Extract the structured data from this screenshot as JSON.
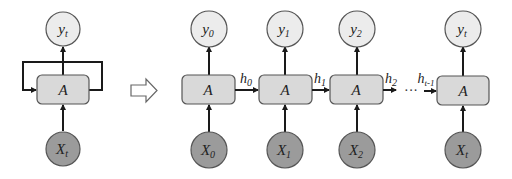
{
  "diagram": {
    "colors": {
      "output_fill": "#ececec",
      "input_fill": "#9b9b9b",
      "cell_fill": "#d9d9d9",
      "stroke": "#555555",
      "edge": "#1a1a1a"
    },
    "folded": {
      "output": {
        "base": "y",
        "sub": "t"
      },
      "cell": "A",
      "input": {
        "base": "X",
        "sub": "t"
      }
    },
    "transform_arrow": "unroll-arrow",
    "unrolled": [
      {
        "output": {
          "base": "y",
          "sub": "0"
        },
        "cell": "A",
        "input": {
          "base": "X",
          "sub": "0"
        },
        "hidden_out": {
          "base": "h",
          "sub": "0"
        }
      },
      {
        "output": {
          "base": "y",
          "sub": "1"
        },
        "cell": "A",
        "input": {
          "base": "X",
          "sub": "1"
        },
        "hidden_out": {
          "base": "h",
          "sub": "1"
        }
      },
      {
        "output": {
          "base": "y",
          "sub": "2"
        },
        "cell": "A",
        "input": {
          "base": "X",
          "sub": "2"
        },
        "hidden_out": {
          "base": "h",
          "sub": "2"
        }
      },
      {
        "output": {
          "base": "y",
          "sub": "t"
        },
        "cell": "A",
        "input": {
          "base": "X",
          "sub": "t"
        },
        "hidden_in": {
          "base": "h",
          "sub": "t-1"
        }
      }
    ],
    "ellipsis": "···"
  }
}
